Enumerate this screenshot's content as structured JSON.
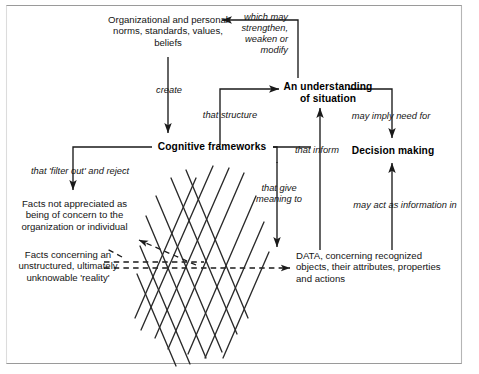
{
  "figure": {
    "type": "flow-diagram",
    "border_color": "#9a9a9a",
    "line_color": "#1a1a1a"
  },
  "nodes": {
    "norms": "Organizational and personal\nnorms, standards, values,\nbeliefs",
    "norms_l1": "Organizational and personal",
    "norms_l2": "norms, standards, values,",
    "norms_l3": "beliefs",
    "cognitive": "Cognitive frameworks",
    "understanding_l1": "An understanding",
    "understanding_l2": "of situation",
    "decision": "Decision making",
    "facts_not_l1": "Facts not appreciated as",
    "facts_not_l2": "being of concern to the",
    "facts_not_l3": "organization or individual",
    "facts_reality_l1": "Facts concerning an",
    "facts_reality_l2": "unstructured, ultimately",
    "facts_reality_l3": "unknowable 'reality'",
    "data_l1": "DATA, concerning recognized",
    "data_l2": "objects, their attributes, properties",
    "data_l3": "and actions"
  },
  "edges": {
    "create": "create",
    "which_may_l1": "which may",
    "which_may_l2": "strengthen,",
    "which_may_l3": "weaken or",
    "which_may_l4": "modify",
    "that_structure": "that structure",
    "that_filter": "that 'filter out' and reject",
    "that_inform": "that inform",
    "that_give_l1": "that give",
    "that_give_l2": "meaning to",
    "may_imply": "may imply need for",
    "may_act": "may act as information in"
  }
}
